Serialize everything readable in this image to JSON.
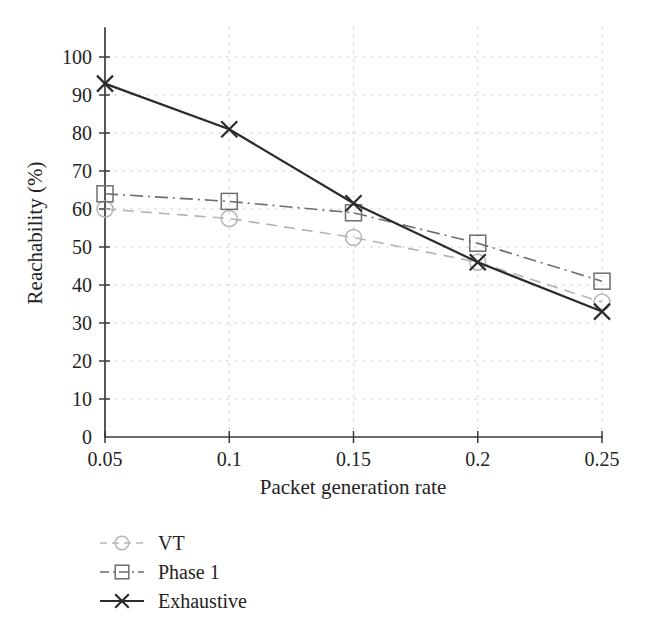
{
  "chart_data": {
    "type": "line",
    "title": "",
    "xlabel": "Packet generation rate",
    "ylabel": "Reachability (%)",
    "x": [
      0.05,
      0.1,
      0.15,
      0.2,
      0.25
    ],
    "xtick_labels": [
      "0.05",
      "0.1",
      "0.15",
      "0.2",
      "0.25"
    ],
    "ytick_labels": [
      "0",
      "10",
      "20",
      "30",
      "40",
      "50",
      "60",
      "70",
      "80",
      "90",
      "100"
    ],
    "yticks": [
      0,
      10,
      20,
      30,
      40,
      50,
      60,
      70,
      80,
      90,
      100
    ],
    "xlim": [
      0.05,
      0.25
    ],
    "ylim": [
      0,
      100
    ],
    "grid": true,
    "grid_style": "dotted",
    "legend_position": "below-left",
    "series": [
      {
        "name": "VT",
        "values": [
          60.0,
          57.5,
          52.5,
          46.0,
          35.5
        ],
        "marker": "circle",
        "line_style": "dashed",
        "color": "#b4b4b4"
      },
      {
        "name": "Phase 1",
        "values": [
          64.0,
          62.0,
          59.0,
          51.0,
          41.0
        ],
        "marker": "square",
        "line_style": "dashdot",
        "color": "#6e6e6e"
      },
      {
        "name": "Exhaustive",
        "values": [
          93.0,
          81.0,
          61.5,
          46.0,
          33.0
        ],
        "marker": "x",
        "line_style": "solid",
        "color": "#2b2b2b"
      }
    ]
  },
  "legend": {
    "items": [
      {
        "label": "VT",
        "marker": "circle-marker",
        "color": "#b4b4b4"
      },
      {
        "label": "Phase 1",
        "marker": "square-marker",
        "color": "#6e6e6e"
      },
      {
        "label": "Exhaustive",
        "marker": "x-marker",
        "color": "#2b2b2b"
      }
    ]
  },
  "axes": {
    "x_title": "Packet generation rate",
    "y_title": "Reachability (%)"
  },
  "colors": {
    "vt": "#b4b4b4",
    "phase1": "#6e6e6e",
    "exhaustive": "#2b2b2b",
    "grid": "#bcbcbc",
    "axis": "#3a3a3a",
    "text": "#232323",
    "background": "#ffffff"
  }
}
